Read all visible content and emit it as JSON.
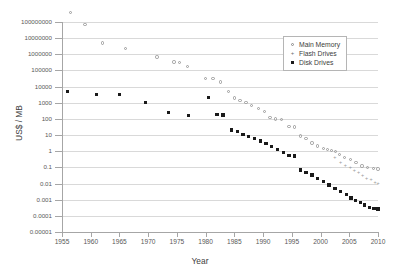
{
  "chart_data": {
    "type": "scatter",
    "title": "",
    "xlabel": "Year",
    "ylabel": "US$ / MB",
    "xlim": [
      1955,
      2010
    ],
    "ylim": [
      1e-05,
      100000000
    ],
    "yscale": "log",
    "grid": true,
    "legend_position": "top-right",
    "xticks": [
      "1955",
      "1960",
      "1965",
      "1970",
      "1975",
      "1980",
      "1985",
      "1990",
      "1995",
      "2000",
      "2005",
      "2010"
    ],
    "yticks": [
      "100000000",
      "10000000",
      "1000000",
      "100000",
      "10000",
      "1000",
      "100",
      "10",
      "1",
      "0.1",
      "0.01",
      "0.001",
      "0.0001",
      "0.00001"
    ],
    "series": [
      {
        "name": "Main Memory",
        "marker": "open-circle",
        "color": "#9a9a9a",
        "points": [
          [
            1956.5,
            400000000
          ],
          [
            1959.0,
            70000000
          ],
          [
            1962.0,
            5000000
          ],
          [
            1966.0,
            2200000
          ],
          [
            1971.5,
            700000
          ],
          [
            1974.5,
            330000
          ],
          [
            1975.5,
            300000
          ],
          [
            1976.8,
            170000
          ],
          [
            1980.0,
            33000
          ],
          [
            1981.3,
            31000
          ],
          [
            1982.6,
            19000
          ],
          [
            1984.0,
            5200
          ],
          [
            1985.0,
            2000
          ],
          [
            1986.0,
            1400
          ],
          [
            1987.0,
            1000
          ],
          [
            1988.0,
            700
          ],
          [
            1989.2,
            430
          ],
          [
            1990.2,
            300
          ],
          [
            1991.2,
            120
          ],
          [
            1992.2,
            100
          ],
          [
            1993.2,
            95
          ],
          [
            1994.5,
            33
          ],
          [
            1995.5,
            31
          ],
          [
            1996.5,
            9
          ],
          [
            1997.5,
            6
          ],
          [
            1998.5,
            3.3
          ],
          [
            1999.5,
            2.1
          ],
          [
            2000.5,
            1.5
          ],
          [
            2001.2,
            1.3
          ],
          [
            2001.9,
            1.1
          ],
          [
            2002.6,
            0.95
          ],
          [
            2003.3,
            0.62
          ],
          [
            2004.2,
            0.42
          ],
          [
            2005.2,
            0.3
          ],
          [
            2006.2,
            0.2
          ],
          [
            2007.2,
            0.12
          ],
          [
            2008.2,
            0.1
          ],
          [
            2009.2,
            0.085
          ],
          [
            2010.0,
            0.08
          ]
        ]
      },
      {
        "name": "Flash Drives",
        "marker": "plus",
        "color": "#9a9a9a",
        "points": [
          [
            2002.5,
            0.42
          ],
          [
            2003.5,
            0.2
          ],
          [
            2004.3,
            0.14
          ],
          [
            2005.2,
            0.1
          ],
          [
            2005.9,
            0.065
          ],
          [
            2006.6,
            0.05
          ],
          [
            2007.3,
            0.035
          ],
          [
            2008.0,
            0.022
          ],
          [
            2008.8,
            0.018
          ],
          [
            2009.5,
            0.013
          ],
          [
            2010.0,
            0.011
          ]
        ]
      },
      {
        "name": "Disk Drives",
        "marker": "filled-square",
        "color": "#1a1a1a",
        "points": [
          [
            1956.0,
            5200
          ],
          [
            1961.0,
            3300
          ],
          [
            1965.0,
            3300
          ],
          [
            1969.5,
            1000
          ],
          [
            1973.5,
            240
          ],
          [
            1977.0,
            170
          ],
          [
            1980.5,
            2100
          ],
          [
            1982.0,
            190
          ],
          [
            1983.0,
            180
          ],
          [
            1984.5,
            21
          ],
          [
            1985.5,
            17
          ],
          [
            1986.5,
            11
          ],
          [
            1987.5,
            8
          ],
          [
            1988.5,
            6
          ],
          [
            1989.5,
            4.2
          ],
          [
            1990.5,
            3.0
          ],
          [
            1991.5,
            2.0
          ],
          [
            1992.5,
            1.3
          ],
          [
            1993.5,
            0.8
          ],
          [
            1994.5,
            0.55
          ],
          [
            1995.5,
            0.5
          ],
          [
            1996.5,
            0.07
          ],
          [
            1997.5,
            0.05
          ],
          [
            1998.5,
            0.033
          ],
          [
            1999.5,
            0.02
          ],
          [
            2000.5,
            0.013
          ],
          [
            2001.5,
            0.008
          ],
          [
            2002.5,
            0.0048
          ],
          [
            2003.5,
            0.0032
          ],
          [
            2004.5,
            0.0021
          ],
          [
            2005.3,
            0.0013
          ],
          [
            2006.1,
            0.0009
          ],
          [
            2006.9,
            0.0007
          ],
          [
            2007.7,
            0.00048
          ],
          [
            2008.5,
            0.00034
          ],
          [
            2009.3,
            0.00028
          ],
          [
            2010.0,
            0.00026
          ]
        ]
      }
    ]
  },
  "legend": {
    "items": [
      {
        "label": "Main Memory",
        "marker": "open-circle"
      },
      {
        "label": "Flash Drives",
        "marker": "plus"
      },
      {
        "label": "Disk Drives",
        "marker": "filled-square"
      }
    ]
  }
}
